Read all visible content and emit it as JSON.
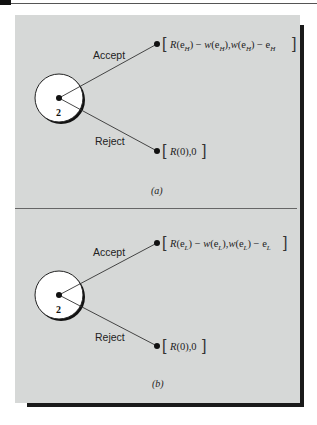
{
  "figure": {
    "panels": [
      {
        "id": "a",
        "caption": "(a)",
        "node": {
          "player": "2"
        },
        "branches": [
          {
            "label": "Accept",
            "payoff": {
              "open": "[",
              "R": "R",
              "arg1": "(e",
              "sub1": "H",
              "arg1c": ")",
              "minus1": " − ",
              "w": "w",
              "arg2": "(e",
              "sub2": "H",
              "arg2c": "),",
              "w2": "w",
              "arg3": "(e",
              "sub3": "H",
              "arg3c": ")",
              "minus2": " − e",
              "sub4": "H",
              "close": "]"
            }
          },
          {
            "label": "Reject",
            "payoff": {
              "open": "[",
              "R": "R",
              "rest": "(0),0",
              "close": "]"
            }
          }
        ]
      },
      {
        "id": "b",
        "caption": "(b)",
        "node": {
          "player": "2"
        },
        "branches": [
          {
            "label": "Accept",
            "payoff": {
              "open": "[",
              "R": "R",
              "arg1": "(e",
              "sub1": "L",
              "arg1c": ")",
              "minus1": " − ",
              "w": "w",
              "arg2": "(e",
              "sub2": "L",
              "arg2c": "),",
              "w2": "w",
              "arg3": "(e",
              "sub3": "L",
              "arg3c": ")",
              "minus2": " − e",
              "sub4": "L",
              "close": "]"
            }
          },
          {
            "label": "Reject",
            "payoff": {
              "open": "[",
              "R": "R",
              "rest": "(0),0",
              "close": "]"
            }
          }
        ]
      }
    ],
    "colors": {
      "panel_bg": "#d6d8d7",
      "shadow": "#1a1a1a",
      "line": "#333333",
      "node_fill": "#ffffff"
    }
  }
}
